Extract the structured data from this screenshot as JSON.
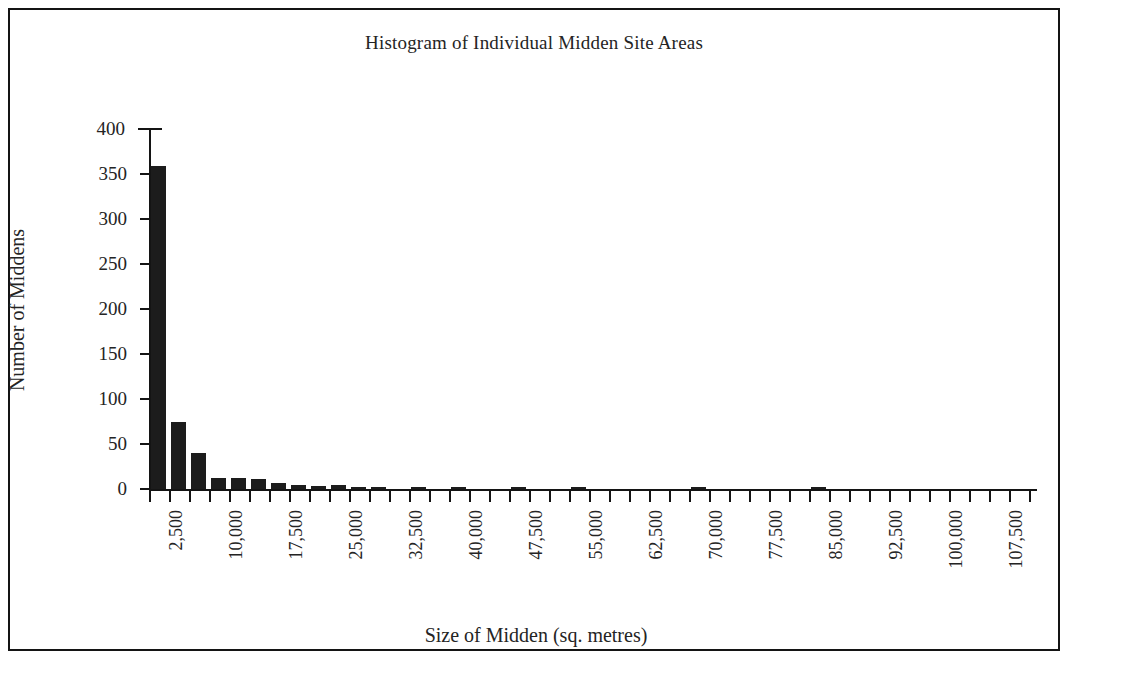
{
  "chart_data": {
    "type": "bar",
    "title": "Histogram of Individual Midden Site Areas",
    "xlabel": "Size of Midden (sq. metres)",
    "ylabel": "Number of Middens",
    "grid": false,
    "legend": null,
    "ylim": [
      0,
      400
    ],
    "ytick_labels": [
      "0",
      "50",
      "100",
      "150",
      "200",
      "250",
      "300",
      "350",
      "400"
    ],
    "ytick_values": [
      0,
      50,
      100,
      150,
      200,
      250,
      300,
      350,
      400
    ],
    "xlim": [
      0,
      110000
    ],
    "bin_width": 2500,
    "xtick_labels": [
      "2,500",
      "10,000",
      "17,500",
      "25,000",
      "32,500",
      "40,000",
      "47,500",
      "55,000",
      "62,500",
      "70,000",
      "77,500",
      "85,000",
      "92,500",
      "100,000",
      "107,500"
    ],
    "xtick_values": [
      2500,
      10000,
      17500,
      25000,
      32500,
      40000,
      47500,
      55000,
      62500,
      70000,
      77500,
      85000,
      92500,
      100000,
      107500
    ],
    "categories": [
      2500,
      5000,
      7500,
      10000,
      12500,
      15000,
      17500,
      20000,
      22500,
      25000,
      27500,
      30000,
      32500,
      35000,
      37500,
      40000,
      42500,
      45000,
      47500,
      50000,
      52500,
      55000,
      57500,
      60000,
      62500,
      65000,
      67500,
      70000,
      72500,
      75000,
      77500,
      80000,
      82500,
      85000,
      87500,
      90000,
      92500,
      95000,
      97500,
      100000,
      102500,
      105000,
      107500,
      110000
    ],
    "values": [
      359,
      75,
      40,
      12,
      12,
      11,
      7,
      4,
      3,
      4,
      1,
      1,
      0,
      1,
      0,
      1,
      0,
      0,
      1,
      0,
      0,
      1,
      0,
      0,
      0,
      0,
      0,
      1,
      0,
      0,
      0,
      0,
      0,
      1,
      0,
      0,
      0,
      0,
      0,
      0,
      0,
      0,
      0,
      0
    ]
  }
}
